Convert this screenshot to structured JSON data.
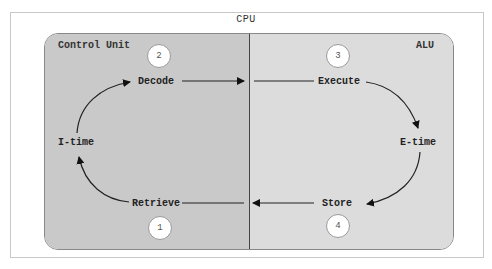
{
  "diagram": {
    "title": "CPU",
    "regions": {
      "control_unit": {
        "label": "Control Unit",
        "color": "#c9c9c9"
      },
      "alu": {
        "label": "ALU",
        "color": "#dcdcdc"
      }
    },
    "steps": [
      {
        "number": "1",
        "label": "Retrieve"
      },
      {
        "number": "2",
        "label": "Decode"
      },
      {
        "number": "3",
        "label": "Execute"
      },
      {
        "number": "4",
        "label": "Store"
      }
    ],
    "phases": {
      "instruction_time": "I-time",
      "execution_time": "E-time"
    },
    "flow": [
      "Retrieve -> I-time",
      "I-time -> Decode",
      "Decode -> Execute",
      "Execute -> E-time",
      "E-time -> Store",
      "Store -> Retrieve"
    ]
  }
}
